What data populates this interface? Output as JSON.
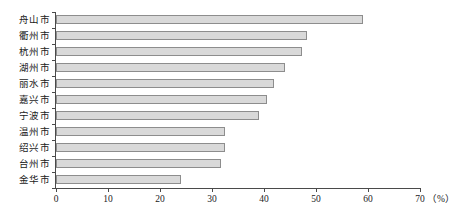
{
  "chart_data": {
    "type": "bar",
    "orientation": "horizontal",
    "title": "",
    "xlabel": "（%）",
    "ylabel": "",
    "xlim": [
      0,
      70
    ],
    "xticks": [
      0,
      10,
      20,
      30,
      40,
      50,
      60,
      70
    ],
    "grid": false,
    "legend": null,
    "categories": [
      "舟山市",
      "衢州市",
      "杭州市",
      "湖州市",
      "丽水市",
      "嘉兴市",
      "宁波市",
      "温州市",
      "绍兴市",
      "台州市",
      "金华市"
    ],
    "values": [
      59,
      48.3,
      47.3,
      44,
      42,
      40.5,
      39,
      32.5,
      32.5,
      31.8,
      24
    ],
    "unit": "%",
    "unit_label": "（%）",
    "colors": {
      "bar_fill": "#d9d9d9",
      "bar_border": "#8d8d8d",
      "axis": "#4a4a4a",
      "text": "#1a1a1a",
      "background": "#ffffff"
    }
  }
}
